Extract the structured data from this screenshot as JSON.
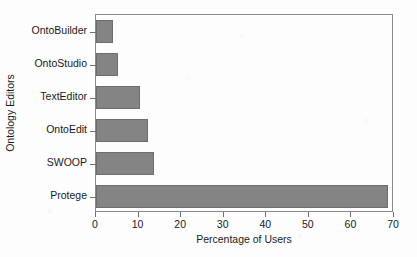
{
  "chart_data": {
    "type": "bar",
    "orientation": "horizontal",
    "title": "",
    "subtitle": "",
    "xlabel": "Percentage of Users",
    "ylabel": "Ontology Editors",
    "categories": [
      "OntoBuilder",
      "OntoStudio",
      "TextEditor",
      "OntoEdit",
      "SWOOP",
      "Protege"
    ],
    "values": [
      3.9,
      5.1,
      10.4,
      12.1,
      13.6,
      68.7
    ],
    "xlim": [
      0,
      70
    ],
    "xticks": [
      0,
      10,
      20,
      30,
      40,
      50,
      60,
      70
    ],
    "xtick_labels": [
      "0",
      "10",
      "20",
      "30",
      "40",
      "50",
      "60",
      "70"
    ],
    "grid": false,
    "legend": null,
    "bar_color": "#848484",
    "bar_edge_color": "#6d6d6d",
    "axis_color": "#8a8a8a",
    "background_color": "#fdfdfd",
    "text_color": "#1a1a1a"
  }
}
